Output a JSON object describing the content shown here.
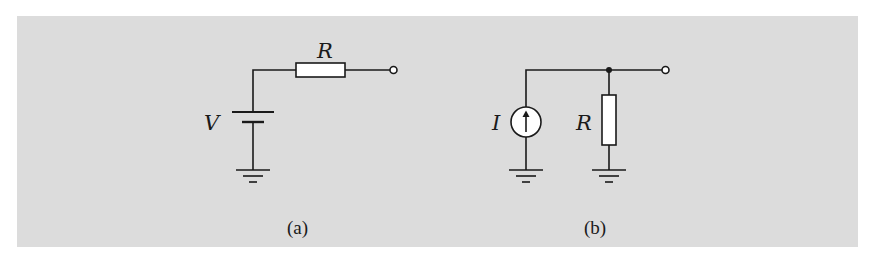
{
  "figure": {
    "background_color": "#dcdcdc",
    "line_color": "#1a1a1a",
    "subfigures": [
      {
        "id": "a",
        "caption": "(a)",
        "title": "Voltage source with series resistor",
        "components": [
          {
            "type": "battery",
            "label": "V"
          },
          {
            "type": "resistor",
            "label": "R",
            "orientation": "horizontal"
          },
          {
            "type": "ground"
          },
          {
            "type": "terminal"
          }
        ]
      },
      {
        "id": "b",
        "caption": "(b)",
        "title": "Current source with parallel resistor",
        "components": [
          {
            "type": "current-source",
            "label": "I",
            "arrow": "up"
          },
          {
            "type": "resistor",
            "label": "R",
            "orientation": "vertical"
          },
          {
            "type": "junction"
          },
          {
            "type": "ground"
          },
          {
            "type": "ground"
          },
          {
            "type": "terminal"
          }
        ]
      }
    ]
  }
}
